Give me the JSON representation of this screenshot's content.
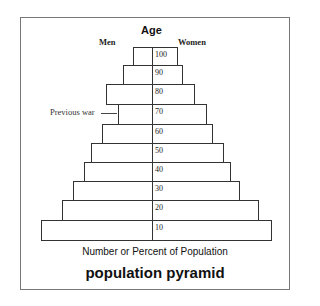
{
  "chart_data": {
    "type": "bar",
    "orientation": "horizontal",
    "title": "population pyramid",
    "ylabel": "Age",
    "xlabel": "Number or Percent of Population",
    "left_label": "Men",
    "right_label": "Women",
    "categories": [
      "100",
      "90",
      "80",
      "70",
      "60",
      "50",
      "40",
      "30",
      "20",
      "10"
    ],
    "bars": [
      {
        "label": "100",
        "left": 133,
        "right": 178,
        "top": 47,
        "bottom": 65
      },
      {
        "label": "90",
        "left": 123,
        "right": 183,
        "top": 65,
        "bottom": 84
      },
      {
        "label": "80",
        "left": 106,
        "right": 195,
        "top": 84,
        "bottom": 104
      },
      {
        "label": "70",
        "left": 118,
        "right": 207,
        "top": 104,
        "bottom": 124
      },
      {
        "label": "60",
        "left": 102,
        "right": 213,
        "top": 124,
        "bottom": 143
      },
      {
        "label": "50",
        "left": 91,
        "right": 224,
        "top": 143,
        "bottom": 162
      },
      {
        "label": "40",
        "left": 84,
        "right": 231,
        "top": 162,
        "bottom": 181
      },
      {
        "label": "30",
        "left": 73,
        "right": 240,
        "top": 181,
        "bottom": 200
      },
      {
        "label": "20",
        "left": 62,
        "right": 259,
        "top": 200,
        "bottom": 220
      },
      {
        "label": "10",
        "left": 41,
        "right": 272,
        "top": 220,
        "bottom": 240
      }
    ],
    "annotations": [
      {
        "text": "Previous war",
        "target": "70"
      }
    ],
    "grid": false,
    "legend": null
  },
  "labels": {
    "age": "Age",
    "men": "Men",
    "women": "Women",
    "previous_war": "Previous war",
    "xlabel": "Number or Percent of Population",
    "title": "population pyramid"
  }
}
